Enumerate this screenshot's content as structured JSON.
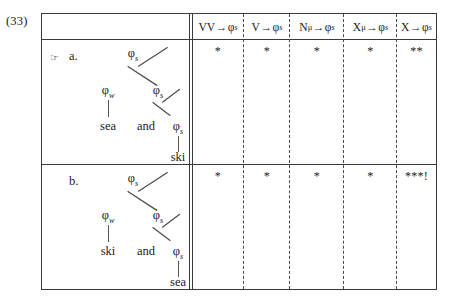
{
  "example_number": "(33)",
  "tableau": {
    "constraints": [
      {
        "id": "vv-phi-s",
        "base": "VV",
        "arrow": "→",
        "target": "φ",
        "target_sub": "s",
        "label": "VV→φs"
      },
      {
        "id": "v-phi-s",
        "base": "V",
        "arrow": "→",
        "target": "φ",
        "target_sub": "s",
        "label": "V→φs"
      },
      {
        "id": "n-mu-phi-s",
        "base": "N",
        "base_sub": "μ",
        "arrow": "→",
        "target": "φ",
        "target_sub": "s",
        "label": "Nμ→φs"
      },
      {
        "id": "x-mu-phi-s",
        "base": "X",
        "base_sub": "μ",
        "arrow": "→",
        "target": "φ",
        "target_sub": "s",
        "label": "Xμ→φs"
      },
      {
        "id": "x-phi-s",
        "base": "X",
        "arrow": "→",
        "target": "φ",
        "target_sub": "s",
        "label": "X→φs"
      }
    ],
    "candidates": [
      {
        "id": "a",
        "label": "a.",
        "optimal": true,
        "pointer": "☞",
        "violations": [
          "*",
          "*",
          "*",
          "*",
          "**"
        ],
        "tree": {
          "nodes": [
            {
              "id": "root",
              "text": "φ",
              "sub": "s"
            },
            {
              "id": "left",
              "text": "φ",
              "sub": "w"
            },
            {
              "id": "right",
              "text": "φ",
              "sub": "s"
            },
            {
              "id": "inner",
              "text": "φ",
              "sub": "s"
            }
          ],
          "leaves": [
            {
              "id": "leaf1",
              "text": "sea"
            },
            {
              "id": "leaf2",
              "text": "and"
            },
            {
              "id": "leaf3",
              "text": "ski"
            }
          ]
        }
      },
      {
        "id": "b",
        "label": "b.",
        "optimal": false,
        "pointer": "",
        "violations": [
          "*",
          "*",
          "*",
          "*",
          "***!"
        ],
        "tree": {
          "nodes": [
            {
              "id": "root",
              "text": "φ",
              "sub": "s"
            },
            {
              "id": "left",
              "text": "φ",
              "sub": "w"
            },
            {
              "id": "right",
              "text": "φ",
              "sub": "s"
            },
            {
              "id": "inner",
              "text": "φ",
              "sub": "s"
            }
          ],
          "leaves": [
            {
              "id": "leaf1",
              "text": "ski"
            },
            {
              "id": "leaf2",
              "text": "and"
            },
            {
              "id": "leaf3",
              "text": "sea"
            }
          ]
        }
      }
    ]
  }
}
